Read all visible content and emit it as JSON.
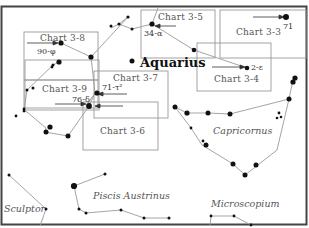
{
  "constellations": {
    "main": "Aquarius",
    "capricornus": "Capricornus",
    "piscis_austrinus": "Piscis Austrinus",
    "sculptor": "Sculptor",
    "microscopium": "Microscopium"
  },
  "charts": [
    {
      "id": "3-3",
      "label": "Chart 3-3"
    },
    {
      "id": "3-4",
      "label": "Chart 3-4"
    },
    {
      "id": "3-5",
      "label": "Chart 3-5"
    },
    {
      "id": "3-6",
      "label": "Chart 3-6"
    },
    {
      "id": "3-7",
      "label": "Chart 3-7"
    },
    {
      "id": "3-8",
      "label": "Chart 3-8"
    },
    {
      "id": "3-9",
      "label": "Chart 3-9"
    }
  ],
  "stars": {
    "s71": "71",
    "s2e": "2-ε",
    "s34a": "34-α",
    "s90p": "90-φ",
    "s71t": "71-τ²",
    "s76d": "76-δ"
  },
  "colors": {
    "frame": "#444444",
    "box": "#999999",
    "line": "#9a9a9a",
    "star": "#111111"
  }
}
